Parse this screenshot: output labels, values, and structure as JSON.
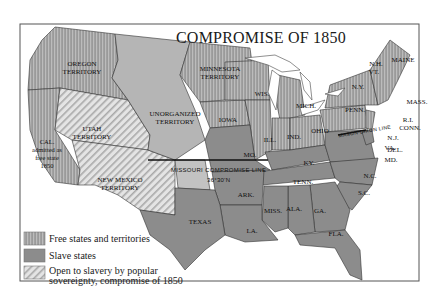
{
  "title": "COMPROMISE OF 1850",
  "colors": {
    "free": "#9a9a9a",
    "free_stripe": "#bdbdbd",
    "slave": "#8c8c8c",
    "unorganized": "#b5b5b5",
    "popular_sovereignty": "#e2e2e2",
    "popular_sovereignty_stripe": "#a8a8a8",
    "water": "#ffffff",
    "border": "#333333"
  },
  "regions": {
    "oregon": "OREGON TERRITORY",
    "minnesota": "MINNESOTA TERRITORY",
    "unorganized": "UNORGANIZED TERRITORY",
    "utah": "UTAH TERRITORY",
    "new_mexico": "NEW MEXICO TERRITORY",
    "california": "CAL. admitted as free state 1850",
    "texas": "TEXAS",
    "iowa": "IOWA",
    "wis": "WIS.",
    "mich": "MICH.",
    "ill": "ILL.",
    "ind": "IND.",
    "ohio": "OHIO",
    "mo": "MO.",
    "ky": "KY.",
    "tenn": "TENN.",
    "ark": "ARK.",
    "la": "LA.",
    "miss": "MISS.",
    "ala": "ALA.",
    "ga": "GA.",
    "fla": "FLA.",
    "sc": "S.C.",
    "nc": "N.C.",
    "va": "VA.",
    "md": "MD.",
    "del": "DEL.",
    "nj": "N.J.",
    "penn": "PENN.",
    "ny": "N.Y.",
    "conn": "CONN.",
    "ri": "R.I.",
    "mass": "MASS.",
    "vt": "VT.",
    "nh": "N.H.",
    "maine": "MAINE"
  },
  "lines": {
    "missouri_compromise": "MISSOURI COMPROMISE LINE",
    "latitude": "36°30'N",
    "mason_dixon": "MASON-DIXON LINE"
  },
  "legend": [
    {
      "label": "Free states and territories"
    },
    {
      "label": "Slave states"
    },
    {
      "label": "Open to slavery by popular sovereignty, compromise of 1850"
    }
  ]
}
